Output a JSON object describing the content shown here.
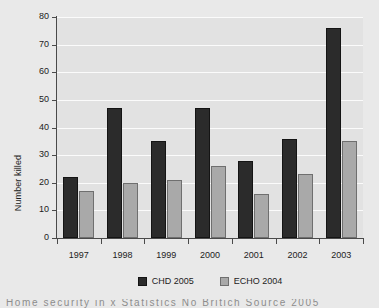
{
  "chart_data": {
    "type": "bar",
    "title": "",
    "subtitle": "",
    "xlabel": "",
    "ylabel": "Number killed",
    "categories": [
      "1997",
      "1998",
      "1999",
      "2000",
      "2001",
      "2002",
      "2003"
    ],
    "series": [
      {
        "name": "CHD 2005",
        "color": "#2b2b2b",
        "values": [
          22,
          47,
          35,
          47,
          28,
          36,
          76
        ]
      },
      {
        "name": "ECHO 2004",
        "color": "#a9a9a9",
        "values": [
          17,
          20,
          21,
          26,
          16,
          23,
          35
        ]
      }
    ],
    "ylim": [
      0,
      80
    ],
    "yticks": [
      0,
      10,
      20,
      30,
      40,
      50,
      60,
      70,
      80
    ],
    "ytick_labels": [
      "0",
      "10",
      "20",
      "30",
      "40",
      "50",
      "60",
      "70",
      "80"
    ],
    "grid": true,
    "grid_axis": "y",
    "legend_position": "bottom",
    "plot_background": "#e2e2e2",
    "figure_background": "#e9e9e9",
    "gridline_color": "#fbfbfb",
    "axis_color": "#4a4a4a"
  },
  "caption": {
    "text": "Home security in x Statistics   No Britich Source 2005"
  }
}
